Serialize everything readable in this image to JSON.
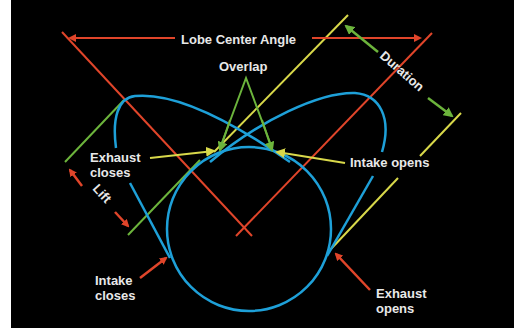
{
  "labels": {
    "lobe_center_angle": "Lobe Center Angle",
    "overlap": "Overlap",
    "duration": "Duration",
    "exhaust_closes_1": "Exhaust",
    "exhaust_closes_2": "closes",
    "intake_opens": "Intake opens",
    "lift": "Lift",
    "intake_closes_1": "Intake",
    "intake_closes_2": "closes",
    "exhaust_opens_1": "Exhaust",
    "exhaust_opens_2": "opens"
  },
  "colors": {
    "background": "#000000",
    "lobe": "#1ea0d8",
    "centerline": "#e0452a",
    "timing": "#d8d84a",
    "measure": "#6cb43c",
    "text": "#e8e8e8"
  }
}
